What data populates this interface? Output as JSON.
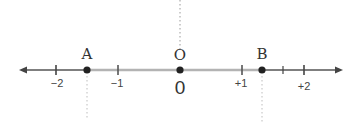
{
  "diagram": {
    "type": "number-line",
    "axis": {
      "min_visible": -2.6,
      "max_visible": 2.6,
      "unit_px": 62,
      "origin_px": 180,
      "y_px": 70,
      "arrow_left_px": 19,
      "arrow_right_px": 342,
      "line_color": "#555555",
      "highlight_color": "#b3b3b3"
    },
    "ticks": [
      {
        "value": -2,
        "label": "−2"
      },
      {
        "value": -1,
        "label": "−1"
      },
      {
        "value": 0,
        "label": "0"
      },
      {
        "value": 1,
        "label": "+1"
      },
      {
        "value": 2,
        "label": "+2"
      }
    ],
    "minor_ticks": [
      {
        "value": 1.67
      }
    ],
    "points": [
      {
        "name": "A",
        "label": "A",
        "value": -1.5
      },
      {
        "name": "O",
        "label": "O",
        "value": 0
      },
      {
        "name": "B",
        "label": "B",
        "value": 1.33
      }
    ],
    "highlighted_segment": {
      "from": "A",
      "to": "B",
      "color": "#b3b3b3"
    },
    "dotted_guides": [
      {
        "at": "O",
        "direction": "up"
      },
      {
        "at": "A",
        "direction": "down"
      },
      {
        "at": "B",
        "direction": "down"
      }
    ],
    "origin_big_label": "0"
  }
}
